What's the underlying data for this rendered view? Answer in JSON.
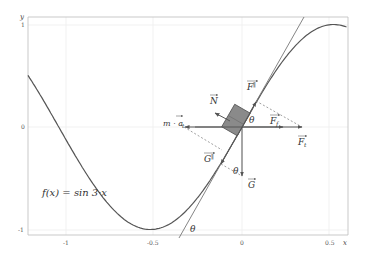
{
  "figure": {
    "type": "physics-diagram",
    "function_label": "f(x) = sin 3·x",
    "axes": {
      "x_label": "x",
      "y_label": "y",
      "x_ticks": [
        {
          "value": -1,
          "label": "-1"
        },
        {
          "value": -0.5,
          "label": "-0.5"
        },
        {
          "value": 0,
          "label": "0"
        },
        {
          "value": 0.5,
          "label": "0.5"
        }
      ],
      "y_ticks": [
        {
          "value": 1,
          "label": "1"
        },
        {
          "value": 0,
          "label": "0"
        },
        {
          "value": -1,
          "label": "-1"
        }
      ],
      "x_range": [
        -1.22,
        0.6
      ],
      "y_range": [
        -1.07,
        1.08
      ]
    },
    "vectors": {
      "N": {
        "label": "N",
        "sub": ""
      },
      "F_parallel": {
        "label": "F",
        "sub": "∥"
      },
      "F_f": {
        "label": "F",
        "sub": "f"
      },
      "F_t": {
        "label": "F",
        "sub": "t"
      },
      "G": {
        "label": "G",
        "sub": ""
      },
      "G_parallel": {
        "label": "G",
        "sub": "∥"
      },
      "inertial": {
        "label": "m · a",
        "sub": "t"
      }
    },
    "angles": {
      "theta_top": "θ",
      "theta_mid": "θ",
      "theta_bottom": "θ"
    },
    "colors": {
      "curve": "#555555",
      "tangent": "#666666",
      "block": "#8a8a8a",
      "grid": "#eeeeee",
      "frame": "#bbbbbb",
      "vector": "#555555",
      "dashed": "#777777"
    }
  }
}
